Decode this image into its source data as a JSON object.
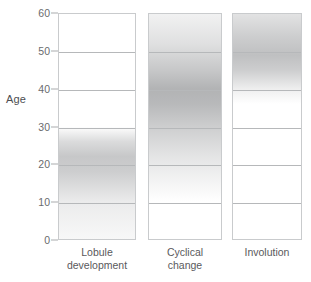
{
  "chart_data": {
    "type": "heatmap",
    "title": "",
    "xlabel": "",
    "ylabel": "Age",
    "ylim": [
      0,
      60
    ],
    "yticks": [
      0,
      10,
      20,
      30,
      40,
      50,
      60
    ],
    "ytick_labels": [
      "0",
      "10",
      "20",
      "30",
      "40",
      "50",
      "60"
    ],
    "grid": true,
    "legend": false,
    "categories": [
      "Lobule development",
      "Cyclical change",
      "Involution"
    ],
    "series": [
      {
        "name": "Lobule development",
        "label_lines": [
          "Lobule",
          "development"
        ],
        "age_range": [
          0,
          30
        ],
        "peak_age": 22,
        "intensity_profile": [
          {
            "age": 0,
            "intensity": 0.08
          },
          {
            "age": 10,
            "intensity": 0.22
          },
          {
            "age": 18,
            "intensity": 0.55
          },
          {
            "age": 22,
            "intensity": 0.62
          },
          {
            "age": 26,
            "intensity": 0.4
          },
          {
            "age": 30,
            "intensity": 0.0
          }
        ]
      },
      {
        "name": "Cyclical change",
        "label_lines": [
          "Cyclical",
          "change"
        ],
        "age_range": [
          10,
          60
        ],
        "peak_age": 40,
        "intensity_profile": [
          {
            "age": 10,
            "intensity": 0.0
          },
          {
            "age": 15,
            "intensity": 0.12
          },
          {
            "age": 22,
            "intensity": 0.3
          },
          {
            "age": 30,
            "intensity": 0.55
          },
          {
            "age": 36,
            "intensity": 0.78
          },
          {
            "age": 40,
            "intensity": 0.85
          },
          {
            "age": 45,
            "intensity": 0.62
          },
          {
            "age": 52,
            "intensity": 0.35
          },
          {
            "age": 60,
            "intensity": 0.15
          }
        ]
      },
      {
        "name": "Involution",
        "label_lines": [
          "Involution"
        ],
        "age_range": [
          36,
          60
        ],
        "peak_age": 49,
        "intensity_profile": [
          {
            "age": 36,
            "intensity": 0.0
          },
          {
            "age": 40,
            "intensity": 0.18
          },
          {
            "age": 45,
            "intensity": 0.55
          },
          {
            "age": 49,
            "intensity": 0.7
          },
          {
            "age": 54,
            "intensity": 0.55
          },
          {
            "age": 60,
            "intensity": 0.32
          }
        ]
      }
    ],
    "colors": {
      "shade": "#808285",
      "gridline": "#b6b8ba",
      "panel_border": "#c9cbcd",
      "text": "#58595b",
      "background": "#ffffff"
    }
  }
}
